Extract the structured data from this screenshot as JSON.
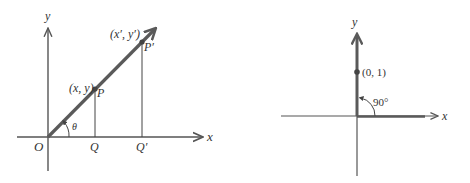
{
  "colors": {
    "vector": "#5a5a5a",
    "axis": "#555555",
    "thin": "#444444",
    "text": "#333333"
  },
  "left_diagram": {
    "axis_x_label": "x",
    "axis_y_label": "y",
    "origin_label": "O",
    "angle_label": "θ",
    "point_p": {
      "label": "P",
      "coord_label": "(x, y)"
    },
    "point_p_prime": {
      "label": "P′",
      "coord_label": "(x′, y′)"
    },
    "foot_q": "Q",
    "foot_q_prime": "Q′"
  },
  "right_diagram": {
    "axis_x_label": "x",
    "axis_y_label": "y",
    "point_label": "(0, 1)",
    "angle_label": "90°"
  }
}
